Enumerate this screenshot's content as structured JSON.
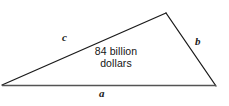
{
  "figure": {
    "type": "geometry-triangle-diagram",
    "background_color": "#ffffff",
    "stroke_color": "#1a1a1a",
    "baseline_color": "#545454",
    "text_color": "#141414",
    "width": 229,
    "height": 106
  },
  "triangle": {
    "vertices": {
      "left": {
        "x": 2,
        "y": 85
      },
      "apex": {
        "x": 166,
        "y": 13
      },
      "bottom_right": {
        "x": 216,
        "y": 86
      }
    },
    "edges": [
      {
        "name": "side-c",
        "label": "c",
        "from": "left",
        "to": "apex"
      },
      {
        "name": "side-b",
        "label": "b",
        "from": "apex",
        "to": "bottom_right"
      },
      {
        "name": "side-a",
        "label": "a",
        "from": "left",
        "to": "bottom_right"
      }
    ]
  },
  "labels": {
    "side_c": "c",
    "side_b": "b",
    "side_a": "a"
  },
  "interior_annotation": {
    "line1": "84 billion",
    "line2": "dollars",
    "full_text": "84 billion dollars"
  }
}
